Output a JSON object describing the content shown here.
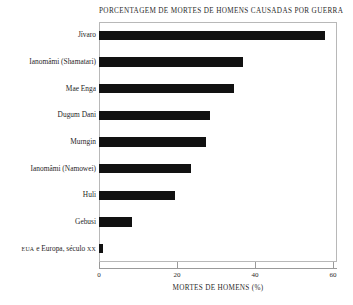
{
  "chart_data": {
    "type": "bar",
    "orientation": "horizontal",
    "title": "Porcentagem de mortes de homens causadas por guerra",
    "xlabel": "Mortes de homens (%)",
    "ylabel": "",
    "categories": [
      "Jívaro",
      "Ianomâmi (Shamatari)",
      "Mae Enga",
      "Dugum Dani",
      "Murngin",
      "Ianomâmi (Namowei)",
      "Huli",
      "Gebusi",
      "EUA e Europa, século XX"
    ],
    "values": [
      58,
      37,
      34.5,
      28.5,
      27.5,
      23.5,
      19.5,
      8.5,
      1
    ],
    "xlim": [
      0,
      61
    ],
    "xticks": [
      0,
      20,
      40,
      60
    ],
    "xtick_labels": [
      "0",
      "20",
      "40",
      "60"
    ],
    "grid": false,
    "legend": null,
    "bar_color": "#111111",
    "frame_color": "#b8b8b8",
    "background": "#ffffff"
  },
  "labels": {
    "eua_prefix": "EUA",
    "eua_mid": " e Europa, século ",
    "eua_suffix": "XX"
  }
}
